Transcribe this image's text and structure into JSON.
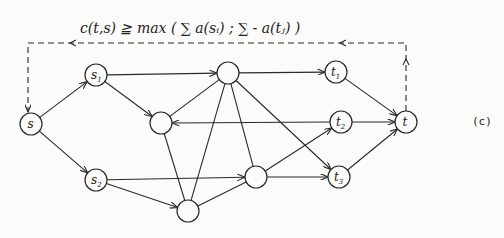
{
  "diagram": {
    "formula": "c(t,s) ≧ max ( ∑ a(sᵢ) ; ∑ - a(tⱼ) )",
    "caption": "(c)",
    "nodes": [
      {
        "id": "s",
        "label": "s",
        "sub": "",
        "x": 31,
        "y": 124
      },
      {
        "id": "s1",
        "label": "s",
        "sub": "1",
        "x": 96,
        "y": 75
      },
      {
        "id": "s2",
        "label": "s",
        "sub": "2",
        "x": 96,
        "y": 180
      },
      {
        "id": "a",
        "label": "",
        "sub": "",
        "x": 161,
        "y": 123
      },
      {
        "id": "b",
        "label": "",
        "sub": "",
        "x": 228,
        "y": 73
      },
      {
        "id": "c",
        "label": "",
        "sub": "",
        "x": 188,
        "y": 211
      },
      {
        "id": "d",
        "label": "",
        "sub": "",
        "x": 256,
        "y": 177
      },
      {
        "id": "t1",
        "label": "t",
        "sub": "1",
        "x": 336,
        "y": 72
      },
      {
        "id": "t2",
        "label": "t",
        "sub": "2",
        "x": 341,
        "y": 122
      },
      {
        "id": "t3",
        "label": "t",
        "sub": "3",
        "x": 339,
        "y": 177
      },
      {
        "id": "t",
        "label": "t",
        "sub": "",
        "x": 406,
        "y": 122
      }
    ],
    "edges": [
      [
        "s",
        "s1",
        true
      ],
      [
        "s",
        "s2",
        true
      ],
      [
        "s1",
        "b",
        true
      ],
      [
        "s1",
        "a",
        true
      ],
      [
        "s2",
        "d",
        true
      ],
      [
        "s2",
        "c",
        true
      ],
      [
        "b",
        "t1",
        true
      ],
      [
        "b",
        "a",
        false
      ],
      [
        "b",
        "c",
        false
      ],
      [
        "b",
        "d",
        false
      ],
      [
        "b",
        "t3",
        true
      ],
      [
        "t2",
        "a",
        true
      ],
      [
        "a",
        "c",
        false
      ],
      [
        "c",
        "d",
        false
      ],
      [
        "d",
        "t2",
        true
      ],
      [
        "d",
        "t3",
        true
      ],
      [
        "t1",
        "t",
        true
      ],
      [
        "t2",
        "t",
        true
      ],
      [
        "t3",
        "t",
        true
      ]
    ],
    "feedback_edge": {
      "from": "t",
      "to": "s",
      "style": "dashed",
      "top_y": 43
    }
  }
}
